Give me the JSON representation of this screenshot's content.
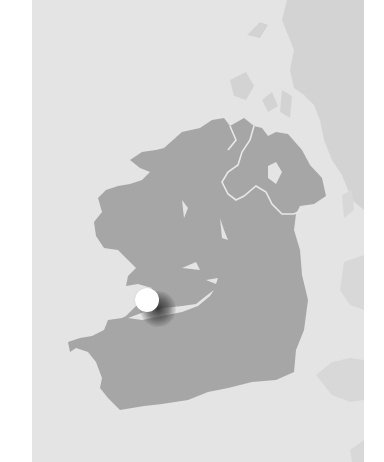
{
  "map": {
    "region": "Ireland",
    "colors": {
      "sea": "#e4e4e4",
      "ireland_land": "#a6a6a6",
      "neighbouring_land": "#d3d3d3",
      "border_lines": "#e8e8e8",
      "page_background": "#ffffff"
    },
    "marker": {
      "icon": "location-pin-icon",
      "color": "#ffffff",
      "approx_position_px": [
        147,
        300
      ],
      "approx_location": "Shannon estuary, west Ireland"
    }
  }
}
